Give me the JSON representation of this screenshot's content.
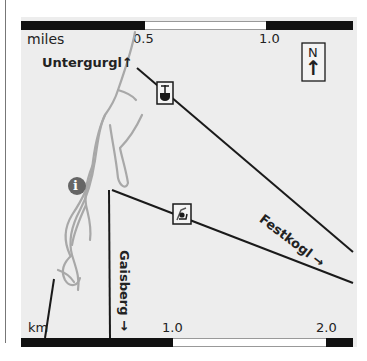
{
  "map": {
    "scale_top": {
      "unit": "miles",
      "ticks": [
        "0.5",
        "1.0"
      ]
    },
    "scale_bottom": {
      "unit": "km",
      "ticks": [
        "1.0",
        "2.0"
      ]
    },
    "compass": {
      "label": "N",
      "arrow": "↑"
    },
    "places": {
      "untergurgl": "Untergurgl",
      "untergurgl_arrow": "↑",
      "festkogl": "Festkogl",
      "festkogl_arrow": "→",
      "gaisberg": "Gaisberg",
      "gaisberg_arrow": "→"
    },
    "icons": {
      "info": "i",
      "gondola": "gondola-icon",
      "chairlift": "chairlift-icon"
    },
    "colors": {
      "background": "#ededed",
      "river": "#a8a8a8",
      "lift_line": "#1a1a1a",
      "info_badge": "#666666"
    }
  }
}
